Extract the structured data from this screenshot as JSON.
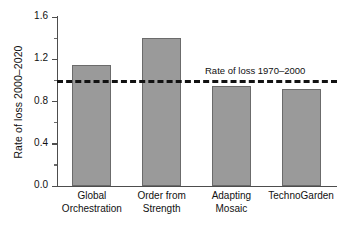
{
  "chart_data": {
    "type": "bar",
    "title": "",
    "xlabel": "",
    "ylabel": "Rate of loss 2000–2020",
    "categories": [
      "Global Orchestration",
      "Order from Strength",
      "Adapting Mosaic",
      "TechnoGarden"
    ],
    "category_lines": [
      [
        "Global",
        "Orchestration"
      ],
      [
        "Order from",
        "Strength"
      ],
      [
        "Adapting",
        "Mosaic"
      ],
      [
        "TechnoGarden",
        ""
      ]
    ],
    "values": [
      1.15,
      1.4,
      0.95,
      0.92
    ],
    "ylim": [
      0.0,
      1.6
    ],
    "yticks": [
      0.0,
      0.4,
      0.8,
      1.2,
      1.6
    ],
    "ytick_labels": [
      "0.0",
      "0.4",
      "0.8",
      "1.2",
      "1.6"
    ],
    "yticks_minor": [
      0.2,
      0.6,
      1.0,
      1.4
    ],
    "grid": false,
    "legend": "none",
    "bar_color": "#9a9a9a",
    "bar_edge_color": "#6b6b6b",
    "axis_color": "#4d4d4d",
    "reference_line": {
      "value": 1.0,
      "label": "Rate of loss 1970–2000",
      "style": "dashed",
      "color": "#121212"
    }
  }
}
